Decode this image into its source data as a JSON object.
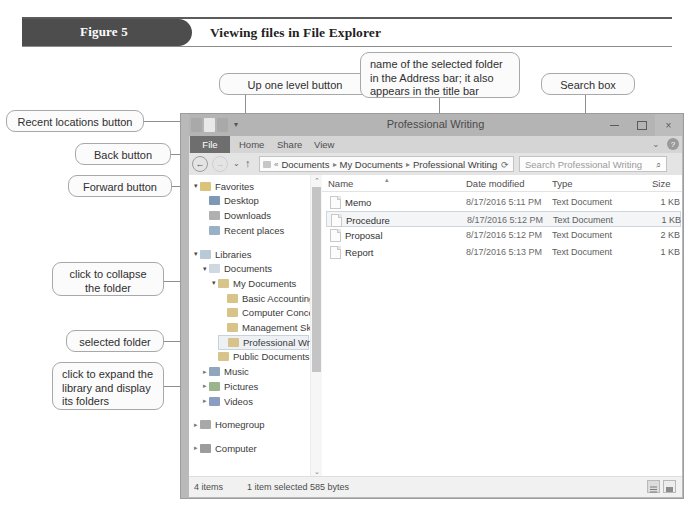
{
  "figure": {
    "tab_label": "Figure 5",
    "caption": "Viewing files in File Explorer"
  },
  "callouts": [
    {
      "id": "recent-locations",
      "text": "Recent locations button"
    },
    {
      "id": "back-button",
      "text": "Back button"
    },
    {
      "id": "forward-button",
      "text": "Forward button"
    },
    {
      "id": "up-one-level",
      "text": "Up one level button"
    },
    {
      "id": "address-name",
      "text": "name of the selected folder in the Address bar; it also appears in the title bar"
    },
    {
      "id": "search-box",
      "text": "Search box"
    },
    {
      "id": "collapse-folder",
      "text": "click to collapse the folder"
    },
    {
      "id": "selected-folder",
      "text": "selected folder"
    },
    {
      "id": "expand-library",
      "text": "click to expand the library and display its folders"
    },
    {
      "id": "folder-contents",
      "text": "contents of the selected folder"
    }
  ],
  "window": {
    "title": "Professional Writing",
    "controls": {
      "minimize": "minimize-icon",
      "maximize": "maximize-icon",
      "close": "×"
    },
    "quick_access": [
      "save-icon",
      "undo-icon",
      "redo-icon",
      "properties-icon"
    ],
    "quick_access_dropdown": "▾",
    "ribbon": {
      "file_tab": "File",
      "tabs": [
        "Home",
        "Share",
        "View"
      ],
      "chevron": "⌄",
      "help_icon": "?"
    },
    "address_bar": {
      "back": "←",
      "forward": "→",
      "recent_locations": "⌄",
      "up_one_level": "↑",
      "root_sep": "«",
      "crumbs": [
        "Documents",
        "My Documents",
        "Professional Writing"
      ],
      "separator": "▸",
      "dropdown": "⌄",
      "refresh": "⟳"
    },
    "search": {
      "placeholder": "Search Professional Writing",
      "icon": "⌕"
    }
  },
  "nav_pane": {
    "scroll_up": "⌃",
    "scroll_down": "⌄",
    "tree": [
      {
        "label": "Favorites",
        "indent": 0,
        "twisty": "▾",
        "icon": "favorites-icon",
        "color": "#dcc37a",
        "selected": false
      },
      {
        "label": "Desktop",
        "indent": 1,
        "twisty": "",
        "icon": "desktop-icon",
        "color": "#7e99b5",
        "selected": false
      },
      {
        "label": "Downloads",
        "indent": 1,
        "twisty": "",
        "icon": "downloads-icon",
        "color": "#b0b0b0",
        "selected": false
      },
      {
        "label": "Recent places",
        "indent": 1,
        "twisty": "",
        "icon": "recent-icon",
        "color": "#9ab0c4",
        "selected": false
      },
      {
        "label": "",
        "indent": 0,
        "twisty": "",
        "icon": "spacer",
        "color": "transparent",
        "selected": false
      },
      {
        "label": "Libraries",
        "indent": 0,
        "twisty": "▾",
        "icon": "libraries-icon",
        "color": "#b9c9d8",
        "selected": false
      },
      {
        "label": "Documents",
        "indent": 1,
        "twisty": "▾",
        "icon": "documents-icon",
        "color": "#cfd8e0",
        "selected": false
      },
      {
        "label": "My Documents",
        "indent": 2,
        "twisty": "▾",
        "icon": "folder-icon",
        "color": "#d8c48a",
        "selected": false
      },
      {
        "label": "Basic Accounting",
        "indent": 3,
        "twisty": "",
        "icon": "folder-icon",
        "color": "#d8c48a",
        "selected": false
      },
      {
        "label": "Computer Concepts",
        "indent": 3,
        "twisty": "",
        "icon": "folder-icon",
        "color": "#d8c48a",
        "selected": false
      },
      {
        "label": "Management Skills",
        "indent": 3,
        "twisty": "",
        "icon": "folder-icon",
        "color": "#d8c48a",
        "selected": false
      },
      {
        "label": "Professional Writing",
        "indent": 3,
        "twisty": "",
        "icon": "folder-icon",
        "color": "#d8c48a",
        "selected": true
      },
      {
        "label": "Public Documents",
        "indent": 2,
        "twisty": "",
        "icon": "folder-icon",
        "color": "#d8c48a",
        "selected": false
      },
      {
        "label": "Music",
        "indent": 1,
        "twisty": "▸",
        "icon": "music-icon",
        "color": "#8fa6bb",
        "selected": false
      },
      {
        "label": "Pictures",
        "indent": 1,
        "twisty": "▸",
        "icon": "pictures-icon",
        "color": "#9ab58e",
        "selected": false
      },
      {
        "label": "Videos",
        "indent": 1,
        "twisty": "▸",
        "icon": "videos-icon",
        "color": "#8b9ec2",
        "selected": false
      },
      {
        "label": "",
        "indent": 0,
        "twisty": "",
        "icon": "spacer",
        "color": "transparent",
        "selected": false
      },
      {
        "label": "Homegroup",
        "indent": 0,
        "twisty": "▸",
        "icon": "homegroup-icon",
        "color": "#a8a8a8",
        "selected": false
      },
      {
        "label": "",
        "indent": 0,
        "twisty": "",
        "icon": "spacer",
        "color": "transparent",
        "selected": false
      },
      {
        "label": "Computer",
        "indent": 0,
        "twisty": "▸",
        "icon": "computer-icon",
        "color": "#9c9c9c",
        "selected": false
      }
    ]
  },
  "file_list": {
    "columns": [
      "Name",
      "Date modified",
      "Type",
      "Size"
    ],
    "sort_indicator": "▴",
    "rows": [
      {
        "name": "Memo",
        "date": "8/17/2016 5:11 PM",
        "type": "Text Document",
        "size": "1 KB",
        "selected": false
      },
      {
        "name": "Procedure",
        "date": "8/17/2016 5:12 PM",
        "type": "Text Document",
        "size": "1 KB",
        "selected": true
      },
      {
        "name": "Proposal",
        "date": "8/17/2016 5:12 PM",
        "type": "Text Document",
        "size": "2 KB",
        "selected": false
      },
      {
        "name": "Report",
        "date": "8/17/2016 5:13 PM",
        "type": "Text Document",
        "size": "1 KB",
        "selected": false
      }
    ]
  },
  "status_bar": {
    "item_count": "4 items",
    "selection": "1 item selected  585 bytes",
    "view_buttons": [
      "details-view-icon",
      "large-icons-view-icon"
    ]
  },
  "colors": {
    "figure_tab": "#4d4d4d",
    "title_bar": "#b4b4b4",
    "ribbon": "#d5d5d5",
    "selection": "#eef1f4",
    "callout_border": "#a8a8a8"
  }
}
